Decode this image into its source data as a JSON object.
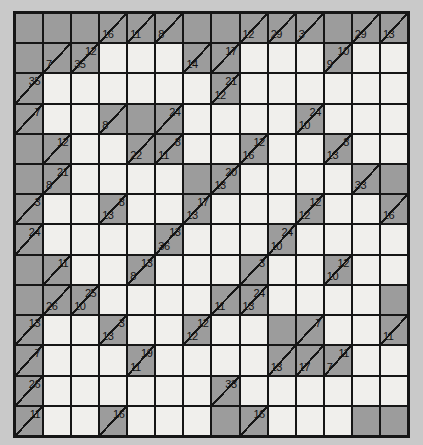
{
  "puzzle": {
    "kind": "kakuro",
    "rows": 14,
    "cols": 14,
    "colors": {
      "page_background": "#c9c9c9",
      "block_fill": "#9c9c9c",
      "entry_fill": "#f0efec",
      "line_color": "#161616",
      "number_color": "#111111"
    },
    "cell_legend": "each cell string: '#'=blocked gray cell, ''=empty white entry cell, 'A|D'=clue cell with across sum A (top-right) and/or down sum D (bottom-left)",
    "grid": [
      [
        "#",
        "#",
        "#",
        "|16",
        "|11",
        "|8",
        "#",
        "#",
        "|12",
        "|29",
        "|3",
        "#",
        "|29",
        "|13"
      ],
      [
        "#",
        "|7",
        "12|35",
        "",
        "",
        "",
        "|14",
        "17|",
        "",
        "",
        "",
        "10|9",
        "",
        ""
      ],
      [
        "35|",
        "",
        "",
        "",
        "",
        "",
        "",
        "21|12",
        "",
        "",
        "",
        "",
        "",
        ""
      ],
      [
        "7|",
        "",
        "",
        "|8",
        "#",
        "24|",
        "",
        "",
        "",
        "",
        "24|10",
        "",
        "",
        ""
      ],
      [
        "#",
        "12|",
        "",
        "",
        "|22",
        "8|11",
        "",
        "",
        "12|16",
        "",
        "",
        "8|13",
        "",
        ""
      ],
      [
        "#",
        "21|8",
        "",
        "",
        "",
        "",
        "#",
        "20|13",
        "",
        "",
        "",
        "",
        "|33",
        "#"
      ],
      [
        "3|",
        "",
        "",
        "8|13",
        "",
        "",
        "17|13",
        "",
        "",
        "",
        "12|12",
        "",
        "",
        "|16"
      ],
      [
        "24|",
        "",
        "",
        "",
        "",
        "13|36",
        "",
        "",
        "",
        "24|10",
        "",
        "",
        "",
        ""
      ],
      [
        "#",
        "11|",
        "",
        "",
        "13|8",
        "",
        "",
        "",
        "3|",
        "",
        "",
        "12|10",
        "",
        ""
      ],
      [
        "#",
        "|26",
        "25|10",
        "",
        "",
        "",
        "",
        "|11",
        "24|13",
        "",
        "",
        "",
        "",
        "#"
      ],
      [
        "13|",
        "",
        "",
        "3|13",
        "",
        "",
        "12|12",
        "",
        "",
        "#",
        "7|",
        "",
        "",
        "|11"
      ],
      [
        "7|",
        "",
        "",
        "",
        "19|11",
        "",
        "",
        "",
        "",
        "|13",
        "|17",
        "11|7",
        "",
        ""
      ],
      [
        "26|",
        "",
        "",
        "",
        "",
        "",
        "",
        "33|",
        "",
        "",
        "",
        "",
        "",
        ""
      ],
      [
        "11|",
        "",
        "",
        "16|",
        "",
        "",
        "",
        "#",
        "16|",
        "",
        "",
        "",
        "#",
        "#"
      ]
    ]
  }
}
